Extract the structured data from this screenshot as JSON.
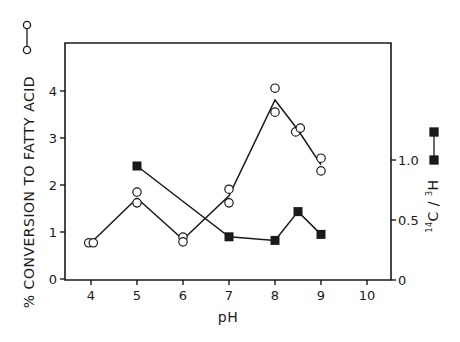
{
  "chart_data": {
    "type": "line",
    "title": "",
    "xlabel": "pH",
    "ylabel": "% CONVERSION TO FATTY ACID",
    "y2label_parts": {
      "sup1": "14",
      "c": "C",
      "slash": " / ",
      "sup2": "3",
      "h": "H"
    },
    "y2label": "14C / 3H",
    "xlim": [
      3.5,
      10.5
    ],
    "ylim": [
      0,
      4.9
    ],
    "y2lim": [
      0,
      2.0
    ],
    "x_ticks": [
      4,
      5,
      6,
      7,
      8,
      9,
      10
    ],
    "x_tick_labels": [
      "4",
      "5",
      "6",
      "7",
      "8",
      "9",
      "10"
    ],
    "y_ticks": [
      0,
      1,
      2,
      3,
      4
    ],
    "y_tick_labels": [
      "0",
      "1",
      "2",
      "3",
      "4"
    ],
    "y2_ticks": [
      0,
      0.5,
      1.0
    ],
    "y2_tick_labels": [
      "0",
      "0.5",
      "1.0"
    ],
    "grid": false,
    "legend_position": "axis-side symbols",
    "series": [
      {
        "name": "% conversion to fatty acid",
        "marker": "open-circle",
        "axis": "left",
        "points": [
          {
            "x": 3.95,
            "y": 0.77
          },
          {
            "x": 4.05,
            "y": 0.77
          },
          {
            "x": 5.0,
            "y": 1.85
          },
          {
            "x": 5.0,
            "y": 1.62
          },
          {
            "x": 6.0,
            "y": 0.89
          },
          {
            "x": 6.0,
            "y": 0.79
          },
          {
            "x": 7.0,
            "y": 1.91
          },
          {
            "x": 7.0,
            "y": 1.62
          },
          {
            "x": 8.0,
            "y": 4.06
          },
          {
            "x": 8.0,
            "y": 3.55
          },
          {
            "x": 8.45,
            "y": 3.13
          },
          {
            "x": 8.55,
            "y": 3.21
          },
          {
            "x": 9.0,
            "y": 2.57
          },
          {
            "x": 9.0,
            "y": 2.3
          }
        ],
        "line": {
          "x": [
            4.0,
            5.0,
            6.0,
            7.0,
            8.0,
            8.5,
            9.0
          ],
          "y": [
            0.77,
            1.72,
            0.84,
            1.77,
            3.81,
            3.17,
            2.43
          ]
        }
      },
      {
        "name": "14C / 3H",
        "marker": "filled-square",
        "axis": "right",
        "points": [
          {
            "x": 5.0,
            "y": 0.95
          },
          {
            "x": 7.0,
            "y": 0.36
          },
          {
            "x": 8.0,
            "y": 0.33
          },
          {
            "x": 8.5,
            "y": 0.57
          },
          {
            "x": 9.0,
            "y": 0.38
          }
        ],
        "line": {
          "x": [
            5.0,
            7.0,
            8.0,
            8.5,
            9.0
          ],
          "y": [
            0.95,
            0.36,
            0.33,
            0.57,
            0.38
          ]
        }
      }
    ]
  }
}
